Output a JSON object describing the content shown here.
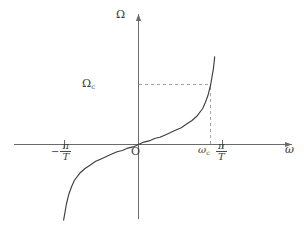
{
  "figure": {
    "title": "",
    "background_color": "#ffffff",
    "axis_color": "#6b6b6b",
    "curve_color": "#3f3f3f",
    "dash_color": "#9a9a9a",
    "text_color": "#3c3c3c"
  },
  "labels": {
    "y_axis": "Ω",
    "y_axis_name": "Omega",
    "y_marker_symbol": "Ω",
    "y_marker_sub": "c",
    "origin": "O",
    "x_axis": "ω",
    "x_axis_name": "omega",
    "neg_sign": "−",
    "pi": "π",
    "T": "T",
    "omega_c_symbol": "ω",
    "omega_c_sub": "c"
  },
  "chart_data": {
    "type": "line",
    "title": "",
    "xlabel": "ω",
    "ylabel": "Ω",
    "grid": false,
    "legend": null,
    "xlim": [
      -3.14159,
      3.14159
    ],
    "ylim": [
      -10,
      10
    ],
    "xticks": [
      -3.14159,
      0,
      2.7,
      3.14159
    ],
    "xticklabels": [
      "−π/T",
      "O",
      "ωc",
      "π/T"
    ],
    "yticks": [
      5.0
    ],
    "yticklabels": [
      "Ωc"
    ],
    "annotations": [
      {
        "name": "omega-c-dashed-vertical",
        "type": "dashed-line",
        "from": [
          2.7,
          0
        ],
        "to": [
          2.7,
          5.0
        ]
      },
      {
        "name": "Omega-c-dashed-horizontal",
        "type": "dashed-line",
        "from": [
          0,
          5.0
        ],
        "to": [
          2.7,
          5.0
        ]
      }
    ],
    "series": [
      {
        "name": "Ω = (2/T) tan(ωT/2)",
        "x": [
          -2.95,
          -2.9,
          -2.85,
          -2.8,
          -2.7,
          -2.6,
          -2.5,
          -2.4,
          -2.2,
          -2.0,
          -1.8,
          -1.6,
          -1.4,
          -1.2,
          -1.0,
          -0.8,
          -0.6,
          -0.4,
          -0.2,
          0.0,
          0.2,
          0.4,
          0.6,
          0.8,
          1.0,
          1.2,
          1.4,
          1.6,
          1.8,
          2.0,
          2.2,
          2.4,
          2.5,
          2.6,
          2.7,
          2.8,
          2.85,
          2.9,
          2.95
        ],
        "y": [
          -10.5,
          -8.6,
          -7.3,
          -6.3,
          -5.0,
          -4.1,
          -3.5,
          -3.0,
          -2.4,
          -2.0,
          -1.7,
          -1.4,
          -1.2,
          -1.0,
          -0.8,
          -0.6,
          -0.5,
          -0.3,
          -0.2,
          0.0,
          0.2,
          0.3,
          0.5,
          0.6,
          0.8,
          1.0,
          1.2,
          1.4,
          1.7,
          2.0,
          2.4,
          3.0,
          3.5,
          4.1,
          5.0,
          6.3,
          7.3,
          8.6,
          10.5
        ]
      }
    ]
  }
}
